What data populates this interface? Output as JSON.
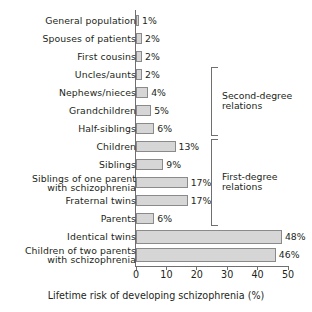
{
  "chart_data": {
    "type": "bar",
    "orientation": "horizontal",
    "title": "",
    "xlabel": "Lifetime risk of developing schizophrenia (%)",
    "ylabel": "",
    "xlim": [
      0,
      50
    ],
    "xticks": [
      "0",
      "10",
      "20",
      "30",
      "40",
      "50"
    ],
    "grid": false,
    "legend": "none",
    "value_suffix": "%",
    "categories": [
      "General population",
      "Spouses of patients",
      "First cousins",
      "Uncles/aunts",
      "Nephews/nieces",
      "Grandchildren",
      "Half-siblings",
      "Children",
      "Siblings",
      "Siblings of one parent\nwith schizophrenia",
      "Fraternal twins",
      "Parents",
      "Identical twins",
      "Children of two parents\nwith schizophrenia"
    ],
    "values": [
      1,
      2,
      2,
      2,
      4,
      5,
      6,
      13,
      9,
      17,
      17,
      6,
      48,
      46
    ],
    "value_labels": [
      "1%",
      "2%",
      "2%",
      "2%",
      "4%",
      "5%",
      "6%",
      "13%",
      "9%",
      "17%",
      "17%",
      "6%",
      "48%",
      "46%"
    ],
    "annotations": [
      {
        "label": "Second-degree\nrelations",
        "covers": [
          "Uncles/aunts",
          "Nephews/nieces",
          "Grandchildren",
          "Half-siblings"
        ]
      },
      {
        "label": "First-degree\nrelations",
        "covers": [
          "Children",
          "Siblings",
          "Siblings of one parent with schizophrenia",
          "Fraternal twins",
          "Parents"
        ]
      }
    ],
    "colors": {
      "bar_fill": "#d6d6d6",
      "bar_stroke": "#8a8a8a",
      "axis": "#6f6f6f",
      "text": "#231f20",
      "background": "#ffffff"
    }
  }
}
